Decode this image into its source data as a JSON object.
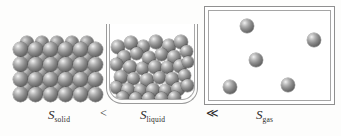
{
  "figure": {
    "background_color": "#fdfdfc",
    "sphere_color": "#6e6e6e",
    "container_line_color": "#9a9a9a",
    "text_color": "#2b2b2b"
  },
  "labels": {
    "solid": {
      "symbol": "S",
      "subscript": "solid"
    },
    "liquid": {
      "symbol": "S",
      "subscript": "liquid"
    },
    "gas": {
      "symbol": "S",
      "subscript": "gas"
    }
  },
  "operators": {
    "first": "<",
    "second": "≪"
  },
  "panels": {
    "solid": {
      "name": "solid-lattice",
      "rows": 4,
      "columns": 6,
      "arrangement": "ordered close-packed lattice",
      "sphere_count": 24,
      "back_layer_sphere_count": 20
    },
    "liquid": {
      "name": "liquid-beaker",
      "container": "beaker",
      "arrangement": "randomly packed spheres filling lower portion",
      "sphere_count": 37
    },
    "gas": {
      "name": "gas-box",
      "container": "rectangular box",
      "arrangement": "sparse spheres widely separated",
      "sphere_count": 5
    }
  },
  "chart_data": {
    "type": "diagram",
    "categories": [
      "S_solid",
      "S_liquid",
      "S_gas"
    ],
    "relation": "S_solid < S_liquid ≪ S_gas",
    "particle_counts": [
      24,
      37,
      5
    ],
    "order_description": [
      "highly ordered lattice, lowest entropy",
      "disordered packed liquid, intermediate entropy",
      "widely dispersed gas particles, highest entropy"
    ]
  },
  "solid_spheres_front": [
    {
      "x": 2,
      "y": 8,
      "d": 15
    },
    {
      "x": 17,
      "y": 8,
      "d": 15
    },
    {
      "x": 32,
      "y": 8,
      "d": 15
    },
    {
      "x": 47,
      "y": 8,
      "d": 15
    },
    {
      "x": 62,
      "y": 8,
      "d": 15
    },
    {
      "x": 77,
      "y": 8,
      "d": 15
    },
    {
      "x": 2,
      "y": 23,
      "d": 15
    },
    {
      "x": 17,
      "y": 23,
      "d": 15
    },
    {
      "x": 32,
      "y": 23,
      "d": 15
    },
    {
      "x": 47,
      "y": 23,
      "d": 15
    },
    {
      "x": 62,
      "y": 23,
      "d": 15
    },
    {
      "x": 77,
      "y": 23,
      "d": 15
    },
    {
      "x": 2,
      "y": 38,
      "d": 15
    },
    {
      "x": 17,
      "y": 38,
      "d": 15
    },
    {
      "x": 32,
      "y": 38,
      "d": 15
    },
    {
      "x": 47,
      "y": 38,
      "d": 15
    },
    {
      "x": 62,
      "y": 38,
      "d": 15
    },
    {
      "x": 77,
      "y": 38,
      "d": 15
    },
    {
      "x": 2,
      "y": 53,
      "d": 15
    },
    {
      "x": 17,
      "y": 53,
      "d": 15
    },
    {
      "x": 32,
      "y": 53,
      "d": 15
    },
    {
      "x": 47,
      "y": 53,
      "d": 15
    },
    {
      "x": 62,
      "y": 53,
      "d": 15
    },
    {
      "x": 77,
      "y": 53,
      "d": 15
    }
  ],
  "solid_spheres_back": [
    {
      "x": 9,
      "y": 2,
      "d": 14
    },
    {
      "x": 24,
      "y": 2,
      "d": 14
    },
    {
      "x": 39,
      "y": 2,
      "d": 14
    },
    {
      "x": 54,
      "y": 2,
      "d": 14
    },
    {
      "x": 69,
      "y": 2,
      "d": 14
    },
    {
      "x": 9,
      "y": 17,
      "d": 14
    },
    {
      "x": 24,
      "y": 17,
      "d": 14
    },
    {
      "x": 39,
      "y": 17,
      "d": 14
    },
    {
      "x": 54,
      "y": 17,
      "d": 14
    },
    {
      "x": 69,
      "y": 17,
      "d": 14
    },
    {
      "x": 9,
      "y": 32,
      "d": 14
    },
    {
      "x": 24,
      "y": 32,
      "d": 14
    },
    {
      "x": 39,
      "y": 32,
      "d": 14
    },
    {
      "x": 54,
      "y": 32,
      "d": 14
    },
    {
      "x": 69,
      "y": 32,
      "d": 14
    },
    {
      "x": 9,
      "y": 47,
      "d": 14
    },
    {
      "x": 24,
      "y": 47,
      "d": 14
    },
    {
      "x": 39,
      "y": 47,
      "d": 14
    },
    {
      "x": 54,
      "y": 47,
      "d": 14
    },
    {
      "x": 69,
      "y": 47,
      "d": 14
    }
  ],
  "liquid_spheres": [
    {
      "x": 1,
      "y": 6,
      "d": 14
    },
    {
      "x": 14,
      "y": 2,
      "d": 14
    },
    {
      "x": 27,
      "y": 6,
      "d": 13
    },
    {
      "x": 39,
      "y": 1,
      "d": 14
    },
    {
      "x": 52,
      "y": 5,
      "d": 14
    },
    {
      "x": 64,
      "y": 1,
      "d": 14
    },
    {
      "x": 70,
      "y": 11,
      "d": 13
    },
    {
      "x": 7,
      "y": 16,
      "d": 14
    },
    {
      "x": 20,
      "y": 13,
      "d": 13
    },
    {
      "x": 32,
      "y": 17,
      "d": 14
    },
    {
      "x": 45,
      "y": 14,
      "d": 13
    },
    {
      "x": 57,
      "y": 16,
      "d": 14
    },
    {
      "x": 0,
      "y": 24,
      "d": 13
    },
    {
      "x": 13,
      "y": 26,
      "d": 14
    },
    {
      "x": 26,
      "y": 28,
      "d": 13
    },
    {
      "x": 38,
      "y": 26,
      "d": 14
    },
    {
      "x": 51,
      "y": 27,
      "d": 13
    },
    {
      "x": 63,
      "y": 25,
      "d": 14
    },
    {
      "x": 72,
      "y": 22,
      "d": 12
    },
    {
      "x": 4,
      "y": 36,
      "d": 14
    },
    {
      "x": 17,
      "y": 38,
      "d": 13
    },
    {
      "x": 30,
      "y": 39,
      "d": 14
    },
    {
      "x": 43,
      "y": 37,
      "d": 13
    },
    {
      "x": 55,
      "y": 38,
      "d": 14
    },
    {
      "x": 68,
      "y": 35,
      "d": 13
    },
    {
      "x": 0,
      "y": 47,
      "d": 13
    },
    {
      "x": 11,
      "y": 49,
      "d": 14
    },
    {
      "x": 24,
      "y": 50,
      "d": 13
    },
    {
      "x": 36,
      "y": 49,
      "d": 14
    },
    {
      "x": 49,
      "y": 50,
      "d": 13
    },
    {
      "x": 61,
      "y": 48,
      "d": 14
    },
    {
      "x": 71,
      "y": 45,
      "d": 13
    },
    {
      "x": 6,
      "y": 57,
      "d": 13
    },
    {
      "x": 19,
      "y": 58,
      "d": 13
    },
    {
      "x": 32,
      "y": 58,
      "d": 13
    },
    {
      "x": 45,
      "y": 58,
      "d": 13
    },
    {
      "x": 58,
      "y": 57,
      "d": 13
    }
  ],
  "gas_spheres": [
    {
      "x": 31,
      "y": 8,
      "d": 14
    },
    {
      "x": 98,
      "y": 22,
      "d": 14
    },
    {
      "x": 40,
      "y": 42,
      "d": 14
    },
    {
      "x": 14,
      "y": 69,
      "d": 14
    },
    {
      "x": 72,
      "y": 67,
      "d": 14
    }
  ]
}
